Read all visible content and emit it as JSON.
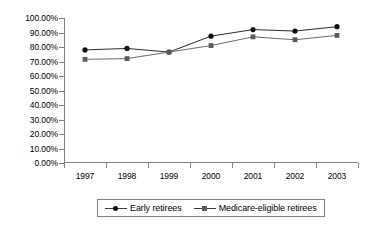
{
  "chart_data": {
    "type": "line",
    "title": "",
    "subtitle": "",
    "xlabel": "",
    "ylabel": "",
    "categories": [
      "1997",
      "1998",
      "1999",
      "2000",
      "2001",
      "2002",
      "2003"
    ],
    "series": [
      {
        "name": "Early retirees",
        "marker": "diamond",
        "color": "#101010",
        "values": [
          78.0,
          79.0,
          76.5,
          87.5,
          92.0,
          91.0,
          94.0
        ]
      },
      {
        "name": "Medicare-eligible retirees",
        "marker": "square",
        "color": "#5a5a5a",
        "values": [
          71.5,
          72.0,
          76.5,
          81.0,
          87.0,
          85.0,
          88.0
        ]
      }
    ],
    "ylim": [
      0,
      100
    ],
    "ytick_step": 10,
    "ytick_labels": [
      "100.00%",
      "90.00%",
      "80.00%",
      "70.00%",
      "60.00%",
      "50.00%",
      "40.00%",
      "30.00%",
      "20.00%",
      "10.00%",
      "0.00%"
    ],
    "ytick_values": [
      100,
      90,
      80,
      70,
      60,
      50,
      40,
      30,
      20,
      10,
      0
    ],
    "grid": false,
    "legend_position": "bottom",
    "axis_color": "#808080"
  },
  "legend": {
    "entries": [
      {
        "label": "Early retirees",
        "marker": "diamond-marker-icon"
      },
      {
        "label": "Medicare-eligible retirees",
        "marker": "square-marker-icon"
      }
    ]
  }
}
